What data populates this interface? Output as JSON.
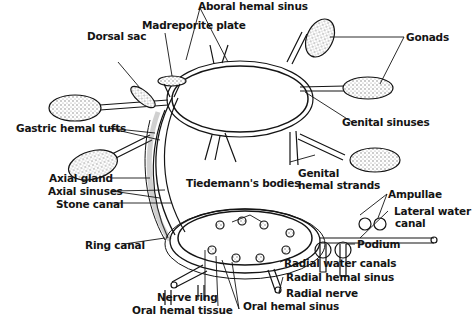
{
  "diagram": {
    "colors": {
      "ink": "#141414",
      "background": "#ffffff",
      "stipple": "#bdbdbd"
    },
    "labels": {
      "aboral_hemal_sinus": "Aboral hemal sinus",
      "gonads": "Gonads",
      "madreporite_plate": "Madreporite plate",
      "dorsal_sac": "Dorsal sac",
      "gastric_hemal_tufts": "Gastric hemal tufts",
      "genital_sinuses": "Genital sinuses",
      "genital_hemal_strands_1": "Genital",
      "genital_hemal_strands_2": "hemal strands",
      "axial_gland": "Axial gland",
      "axial_sinuses": "Axial sinuses",
      "stone_canal": "Stone canal",
      "tiedemanns_bodies": "Tiedemann's bodies",
      "ampullae": "Ampullae",
      "lateral_water_canal_1": "Lateral water",
      "lateral_water_canal_2": "canal",
      "ring_canal": "Ring canal",
      "podium": "Podium",
      "radial_water_canals": "Radial water canals",
      "radial_hemal_sinus": "Radial hemal sinus",
      "radial_nerve": "Radial nerve",
      "nerve_ring": "Nerve ring",
      "oral_hemal_tissue": "Oral hemal tissue",
      "oral_hemal_sinus": "Oral hemal sinus"
    }
  }
}
